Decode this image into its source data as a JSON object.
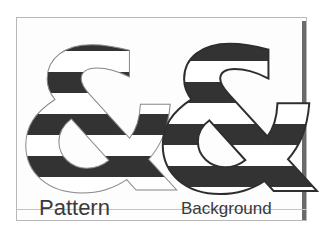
{
  "figure": {
    "glyph": "&",
    "stripe_color": "#333333",
    "fill_color": "#ffffff",
    "outline_thin_color": "#8a8a8a",
    "outline_thick_color": "#2e2e2e",
    "panels": [
      {
        "id": "pattern",
        "label": "Pattern"
      },
      {
        "id": "background",
        "label": "Background"
      }
    ]
  }
}
